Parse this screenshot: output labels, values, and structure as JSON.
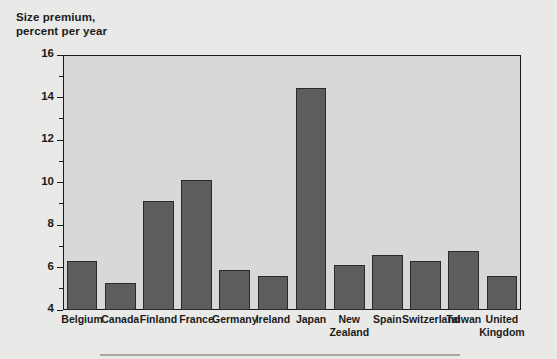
{
  "chart_data": {
    "type": "bar",
    "title": "",
    "axis_title_lines": [
      "Size premium,",
      "percent per year"
    ],
    "xlabel": "",
    "ylabel": "Size premium, percent per year",
    "ylim": [
      4,
      16
    ],
    "ytick_step": 2,
    "yminor_step": 1,
    "grid": false,
    "legend": null,
    "categories": [
      "Belgium",
      "Canada",
      "Finland",
      "France",
      "Germany",
      "Ireland",
      "Japan",
      "New Zealand",
      "Spain",
      "Switzerland",
      "Taiwan",
      "United Kingdom"
    ],
    "values": [
      6.3,
      5.25,
      9.15,
      10.1,
      5.9,
      5.6,
      14.45,
      6.1,
      6.6,
      6.3,
      6.8,
      5.6
    ],
    "ytick_labels": [
      "4",
      "6",
      "8",
      "10",
      "12",
      "14",
      "16"
    ],
    "ytick_values": [
      4,
      6,
      8,
      10,
      12,
      14,
      16
    ],
    "yminor_values": [
      5,
      7,
      9,
      11,
      13,
      15
    ],
    "bar_color": "#5d5d5d",
    "bar_edge_color": "#2a2a2a",
    "plot_background": "#d8d8d6",
    "figure_background": "#e9e9e7",
    "axis_color": "#1a1a1a",
    "text_color": "#1b1b1b"
  }
}
